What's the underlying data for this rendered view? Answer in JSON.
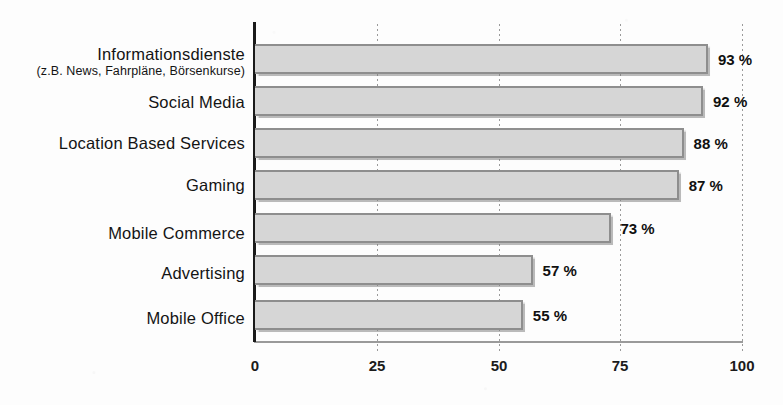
{
  "chart_data": {
    "type": "bar",
    "orientation": "horizontal",
    "title": "",
    "xlabel": "",
    "ylabel": "",
    "xlim": [
      0,
      100
    ],
    "xticks": [
      "0",
      "25",
      "50",
      "75",
      "100"
    ],
    "xtick_values": [
      0,
      25,
      50,
      75,
      100
    ],
    "grid": "vertical-dotted",
    "legend": "none",
    "value_suffix": "%",
    "categories": [
      "Informationsdienste",
      "Social Media",
      "Location Based Services",
      "Gaming",
      "Mobile Commerce",
      "Advertising",
      "Mobile Office"
    ],
    "category_sublabels": [
      "(z.B. News, Fahrpläne, Börsenkurse)",
      "",
      "",
      "",
      "",
      "",
      ""
    ],
    "values": [
      93,
      92,
      88,
      87,
      73,
      57,
      55
    ],
    "value_labels": [
      "93 %",
      "92 %",
      "88 %",
      "87 %",
      "73 %",
      "57 %",
      "55 %"
    ],
    "colors": {
      "bar_fill": "#d6d6d6",
      "bar_border": "#8e8e8e",
      "axis": "#1a1a1a",
      "grid": "#9a9a9a",
      "text": "#141414",
      "background": "#fdfdfd"
    }
  }
}
